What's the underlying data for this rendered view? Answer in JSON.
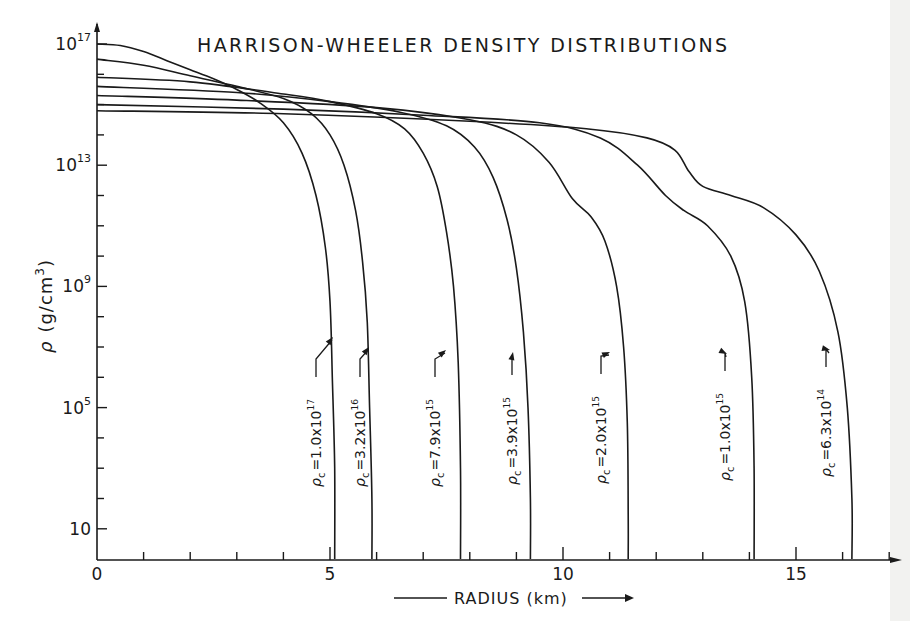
{
  "chart_data": {
    "type": "line",
    "title": "HARRISON-WHEELER DENSITY DISTRIBUTIONS",
    "xlabel": "RADIUS (km)",
    "ylabel": "ρ (g/cm³)",
    "xlim": [
      0,
      17.5
    ],
    "ylim_log10": [
      0,
      17.3
    ],
    "yscale": "log",
    "grid": false,
    "legend": "inline annotations with arrows",
    "x_ticks": [
      {
        "value": 0,
        "label": "0"
      },
      {
        "value": 5,
        "label": "5"
      },
      {
        "value": 10,
        "label": "10"
      },
      {
        "value": 15,
        "label": "15"
      }
    ],
    "x_minor_ticks": [
      1,
      2,
      3,
      4,
      6,
      7,
      8,
      9,
      11,
      12,
      13,
      14,
      16,
      17
    ],
    "y_ticks": [
      {
        "log10": 17,
        "base": "10",
        "exp": "17"
      },
      {
        "log10": 13,
        "base": "10",
        "exp": "13"
      },
      {
        "log10": 9,
        "base": "10",
        "exp": "9"
      },
      {
        "log10": 5,
        "base": "10",
        "exp": "5"
      },
      {
        "log10": 1,
        "base": "10",
        "exp": ""
      }
    ],
    "y_minor_ticks_log10": [
      16,
      15,
      14,
      12,
      11,
      10,
      8,
      7,
      6,
      4,
      3,
      2
    ],
    "series": [
      {
        "name": "ρc = 1.0x10^17",
        "label_base": "=1.0x10",
        "label_exp": "17",
        "central_density": 1e+17,
        "surface_radius_km": 5.1,
        "points": [
          [
            0,
            17.0
          ],
          [
            0.5,
            16.95
          ],
          [
            1.0,
            16.75
          ],
          [
            1.5,
            16.45
          ],
          [
            2.0,
            16.15
          ],
          [
            2.5,
            15.85
          ],
          [
            3.0,
            15.5
          ],
          [
            3.5,
            15.05
          ],
          [
            4.0,
            14.4
          ],
          [
            4.4,
            13.4
          ],
          [
            4.7,
            12.0
          ],
          [
            4.9,
            10.3
          ],
          [
            5.0,
            8.5
          ],
          [
            5.05,
            6.0
          ],
          [
            5.1,
            3.0
          ],
          [
            5.1,
            0
          ]
        ]
      },
      {
        "name": "ρc = 3.2x10^16",
        "label_base": "=3.2x10",
        "label_exp": "16",
        "central_density": 3.2e+16,
        "surface_radius_km": 5.9,
        "points": [
          [
            0,
            16.5
          ],
          [
            1.0,
            16.3
          ],
          [
            2.0,
            15.95
          ],
          [
            3.0,
            15.6
          ],
          [
            4.0,
            15.2
          ],
          [
            4.6,
            14.7
          ],
          [
            5.0,
            14.0
          ],
          [
            5.3,
            13.0
          ],
          [
            5.55,
            11.5
          ],
          [
            5.7,
            9.8
          ],
          [
            5.8,
            7.8
          ],
          [
            5.85,
            5.0
          ],
          [
            5.9,
            2.0
          ],
          [
            5.9,
            0
          ]
        ]
      },
      {
        "name": "ρc = 7.9x10^15",
        "label_base": "=7.9x10",
        "label_exp": "15",
        "central_density": 7900000000000000.0,
        "surface_radius_km": 7.8,
        "points": [
          [
            0,
            15.9
          ],
          [
            2.0,
            15.75
          ],
          [
            4.0,
            15.35
          ],
          [
            5.0,
            15.1
          ],
          [
            6.0,
            14.7
          ],
          [
            6.6,
            14.2
          ],
          [
            7.0,
            13.4
          ],
          [
            7.3,
            12.3
          ],
          [
            7.5,
            10.8
          ],
          [
            7.65,
            9.0
          ],
          [
            7.75,
            6.5
          ],
          [
            7.8,
            3.0
          ],
          [
            7.8,
            0
          ]
        ]
      },
      {
        "name": "ρc = 3.9x10^15",
        "label_base": "=3.9x10",
        "label_exp": "15",
        "central_density": 3900000000000000.0,
        "surface_radius_km": 9.3,
        "points": [
          [
            0,
            15.6
          ],
          [
            3.0,
            15.4
          ],
          [
            5.0,
            15.1
          ],
          [
            6.5,
            14.75
          ],
          [
            7.5,
            14.3
          ],
          [
            8.1,
            13.6
          ],
          [
            8.5,
            12.6
          ],
          [
            8.8,
            11.2
          ],
          [
            9.0,
            9.6
          ],
          [
            9.15,
            7.5
          ],
          [
            9.25,
            5.0
          ],
          [
            9.3,
            2.0
          ],
          [
            9.3,
            0
          ]
        ]
      },
      {
        "name": "ρc = 2.0x10^15",
        "label_base": "=2.0x10",
        "label_exp": "15",
        "central_density": 2000000000000000.0,
        "surface_radius_km": 11.4,
        "points": [
          [
            0,
            15.3
          ],
          [
            3.0,
            15.15
          ],
          [
            6.0,
            14.9
          ],
          [
            8.0,
            14.5
          ],
          [
            9.0,
            14.0
          ],
          [
            9.7,
            13.1
          ],
          [
            10.2,
            11.9
          ],
          [
            10.6,
            11.3
          ],
          [
            10.9,
            10.5
          ],
          [
            11.15,
            9.0
          ],
          [
            11.3,
            7.0
          ],
          [
            11.38,
            4.5
          ],
          [
            11.4,
            1.5
          ],
          [
            11.4,
            0
          ]
        ]
      },
      {
        "name": "ρc = 1.0x10^15",
        "label_base": "=1.0x10",
        "label_exp": "15",
        "central_density": 1000000000000000.0,
        "surface_radius_km": 14.1,
        "points": [
          [
            0,
            15.0
          ],
          [
            4.0,
            14.85
          ],
          [
            7.0,
            14.65
          ],
          [
            9.5,
            14.4
          ],
          [
            10.8,
            13.9
          ],
          [
            11.6,
            13.0
          ],
          [
            12.2,
            12.0
          ],
          [
            12.6,
            11.5
          ],
          [
            13.1,
            11.0
          ],
          [
            13.6,
            10.0
          ],
          [
            13.9,
            8.5
          ],
          [
            14.05,
            6.0
          ],
          [
            14.1,
            3.0
          ],
          [
            14.1,
            0
          ]
        ]
      },
      {
        "name": "ρc = 6.3x10^14",
        "label_base": "=6.3x10",
        "label_exp": "14",
        "central_density": 630000000000000.0,
        "surface_radius_km": 16.2,
        "points": [
          [
            0,
            14.8
          ],
          [
            4.0,
            14.7
          ],
          [
            8.0,
            14.45
          ],
          [
            10.5,
            14.2
          ],
          [
            11.8,
            13.9
          ],
          [
            12.4,
            13.5
          ],
          [
            12.7,
            12.8
          ],
          [
            13.0,
            12.3
          ],
          [
            13.6,
            12.0
          ],
          [
            14.3,
            11.6
          ],
          [
            15.0,
            10.7
          ],
          [
            15.5,
            9.5
          ],
          [
            15.9,
            7.5
          ],
          [
            16.1,
            5.0
          ],
          [
            16.2,
            2.0
          ],
          [
            16.2,
            0
          ]
        ]
      }
    ],
    "annotations": [
      {
        "series": 0,
        "text": "ρc=1.0x10^17"
      },
      {
        "series": 1,
        "text": "ρc=3.2x10^16"
      },
      {
        "series": 2,
        "text": "ρc=7.9x10^15"
      },
      {
        "series": 3,
        "text": "ρc=3.9x10^15"
      },
      {
        "series": 4,
        "text": "ρc=2.0x10^15"
      },
      {
        "series": 5,
        "text": "ρc=1.0x10^15"
      },
      {
        "series": 6,
        "text": "ρc=6.3x10^14"
      }
    ]
  },
  "labels": {
    "title": "HARRISON-WHEELER DENSITY DISTRIBUTIONS",
    "ylabel_rho": "ρ",
    "ylabel_units_pre": "(g/cm",
    "ylabel_units_exp": "3",
    "ylabel_units_post": ")",
    "xlabel": "RADIUS (km)",
    "rho_symbol": "ρ",
    "rho_subscript": "c"
  }
}
